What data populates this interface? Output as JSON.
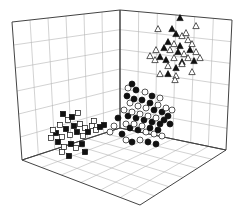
{
  "chart_data": {
    "type": "scatter",
    "projection": "3d",
    "title": "",
    "xlabel": "",
    "ylabel": "",
    "zlabel": "",
    "grid": true,
    "legend": null,
    "axis_ticks_visible": false,
    "box": {
      "left_wall": {
        "tl": [
          12,
          22
        ],
        "tr": [
          120,
          10
        ],
        "br": [
          120,
          128
        ],
        "bl": [
          22,
          160
        ]
      },
      "right_wall": {
        "tl": [
          120,
          10
        ],
        "tr": [
          232,
          20
        ],
        "br": [
          226,
          150
        ],
        "bl": [
          120,
          128
        ]
      },
      "floor": {
        "back": [
          120,
          128
        ],
        "left": [
          22,
          160
        ],
        "front": [
          140,
          205
        ],
        "right": [
          226,
          150
        ]
      },
      "divisions": 6
    },
    "series": [
      {
        "name": "cluster-lower-left",
        "marker": "square",
        "fill": "mixed",
        "description": "open and filled squares near the lower-left wall/floor junction",
        "points": [
          [
            63,
            114,
            "f"
          ],
          [
            68,
            120,
            "o"
          ],
          [
            72,
            117,
            "f"
          ],
          [
            78,
            113,
            "o"
          ],
          [
            60,
            125,
            "o"
          ],
          [
            66,
            129,
            "f"
          ],
          [
            74,
            126,
            "f"
          ],
          [
            80,
            124,
            "o"
          ],
          [
            85,
            128,
            "o"
          ],
          [
            56,
            133,
            "f"
          ],
          [
            62,
            137,
            "o"
          ],
          [
            70,
            135,
            "o"
          ],
          [
            77,
            132,
            "f"
          ],
          [
            83,
            136,
            "o"
          ],
          [
            88,
            132,
            "f"
          ],
          [
            92,
            126,
            "o"
          ],
          [
            58,
            142,
            "f"
          ],
          [
            64,
            147,
            "o"
          ],
          [
            71,
            144,
            "f"
          ],
          [
            76,
            148,
            "o"
          ],
          [
            82,
            144,
            "f"
          ],
          [
            62,
            152,
            "o"
          ],
          [
            69,
            156,
            "f"
          ],
          [
            85,
            152,
            "f"
          ],
          [
            96,
            130,
            "o"
          ],
          [
            100,
            127,
            "f"
          ],
          [
            104,
            125,
            "f"
          ],
          [
            51,
            138,
            "o"
          ],
          [
            53,
            130,
            "o"
          ],
          [
            94,
            121,
            "o"
          ]
        ]
      },
      {
        "name": "cluster-center",
        "marker": "circle",
        "fill": "mixed",
        "description": "dense mix of open and filled circles at the back corner",
        "points": [
          [
            127,
            96,
            "f"
          ],
          [
            130,
            103,
            "o"
          ],
          [
            134,
            99,
            "f"
          ],
          [
            138,
            106,
            "o"
          ],
          [
            142,
            100,
            "f"
          ],
          [
            146,
            108,
            "o"
          ],
          [
            150,
            103,
            "f"
          ],
          [
            154,
            110,
            "f"
          ],
          [
            158,
            105,
            "o"
          ],
          [
            162,
            112,
            "f"
          ],
          [
            166,
            108,
            "o"
          ],
          [
            124,
            110,
            "o"
          ],
          [
            128,
            116,
            "f"
          ],
          [
            132,
            112,
            "o"
          ],
          [
            136,
            118,
            "f"
          ],
          [
            140,
            114,
            "o"
          ],
          [
            144,
            120,
            "f"
          ],
          [
            148,
            116,
            "o"
          ],
          [
            152,
            122,
            "f"
          ],
          [
            156,
            118,
            "o"
          ],
          [
            160,
            124,
            "f"
          ],
          [
            164,
            120,
            "f"
          ],
          [
            126,
            124,
            "o"
          ],
          [
            130,
            128,
            "f"
          ],
          [
            134,
            124,
            "o"
          ],
          [
            138,
            130,
            "f"
          ],
          [
            142,
            126,
            "o"
          ],
          [
            146,
            132,
            "o"
          ],
          [
            150,
            128,
            "f"
          ],
          [
            154,
            134,
            "o"
          ],
          [
            158,
            130,
            "f"
          ],
          [
            162,
            136,
            "o"
          ],
          [
            118,
            118,
            "f"
          ],
          [
            114,
            126,
            "o"
          ],
          [
            110,
            132,
            "o"
          ],
          [
            122,
            134,
            "f"
          ],
          [
            126,
            140,
            "o"
          ],
          [
            132,
            142,
            "f"
          ],
          [
            140,
            140,
            "o"
          ],
          [
            148,
            142,
            "f"
          ],
          [
            156,
            144,
            "f"
          ],
          [
            168,
            116,
            "f"
          ],
          [
            172,
            110,
            "o"
          ],
          [
            170,
            124,
            "f"
          ],
          [
            145,
            92,
            "o"
          ],
          [
            152,
            96,
            "f"
          ],
          [
            160,
            98,
            "o"
          ],
          [
            136,
            90,
            "f"
          ],
          [
            128,
            88,
            "o"
          ],
          [
            132,
            84,
            "f"
          ]
        ]
      },
      {
        "name": "cluster-upper-right",
        "marker": "triangle",
        "fill": "mixed",
        "description": "open and filled triangles high on the right wall",
        "points": [
          [
            180,
            18,
            "f"
          ],
          [
            158,
            29,
            "o"
          ],
          [
            196,
            26,
            "o"
          ],
          [
            172,
            29,
            "f"
          ],
          [
            176,
            34,
            "f"
          ],
          [
            182,
            36,
            "o"
          ],
          [
            186,
            33,
            "o"
          ],
          [
            168,
            42,
            "f"
          ],
          [
            174,
            44,
            "o"
          ],
          [
            180,
            46,
            "f"
          ],
          [
            188,
            40,
            "o"
          ],
          [
            192,
            44,
            "o"
          ],
          [
            164,
            48,
            "f"
          ],
          [
            170,
            50,
            "o"
          ],
          [
            178,
            52,
            "f"
          ],
          [
            184,
            54,
            "o"
          ],
          [
            190,
            50,
            "f"
          ],
          [
            196,
            52,
            "o"
          ],
          [
            156,
            50,
            "o"
          ],
          [
            150,
            56,
            "o"
          ],
          [
            160,
            57,
            "f"
          ],
          [
            166,
            60,
            "f"
          ],
          [
            174,
            58,
            "o"
          ],
          [
            182,
            62,
            "f"
          ],
          [
            188,
            58,
            "o"
          ],
          [
            194,
            61,
            "f"
          ],
          [
            200,
            58,
            "o"
          ],
          [
            155,
            60,
            "o"
          ],
          [
            168,
            66,
            "o"
          ],
          [
            176,
            68,
            "f"
          ],
          [
            182,
            64,
            "o"
          ],
          [
            168,
            74,
            "f"
          ],
          [
            160,
            74,
            "o"
          ],
          [
            176,
            76,
            "o"
          ],
          [
            192,
            72,
            "o"
          ],
          [
            175,
            80,
            "o"
          ]
        ]
      }
    ]
  }
}
